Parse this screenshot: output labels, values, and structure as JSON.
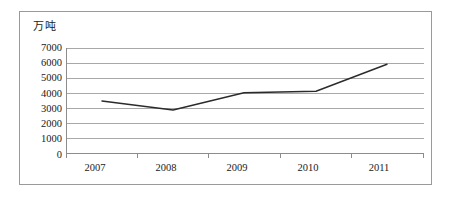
{
  "chart_data": {
    "type": "line",
    "title": "",
    "subtitle": "",
    "xlabel": "",
    "ylabel": "万吨",
    "unit_label": "万吨",
    "categories": [
      "2007",
      "2008",
      "2009",
      "2010",
      "2011"
    ],
    "x": [
      2007,
      2008,
      2009,
      2010,
      2011
    ],
    "values": [
      3500,
      2900,
      4050,
      4150,
      5950
    ],
    "series": [
      {
        "name": "",
        "values": [
          3500,
          2900,
          4050,
          4150,
          5950
        ]
      }
    ],
    "ylim": [
      0,
      7000
    ],
    "yticks": [
      0,
      1000,
      2000,
      3000,
      4000,
      5000,
      6000,
      7000
    ],
    "ytick_labels": [
      "0",
      "1000",
      "2000",
      "3000",
      "4000",
      "5000",
      "6000",
      "7000"
    ],
    "xtick_labels": [
      "2007",
      "2008",
      "2009",
      "2010",
      "2011"
    ],
    "grid": true,
    "grid_axis": "y",
    "legend": false,
    "legend_position": "none",
    "line_color": "#2b2b2b",
    "grid_color": "#a8a8a8",
    "axis_color": "#8c8c8c",
    "frame_color": "#9a9a9a",
    "background": "#ffffff",
    "markers": false,
    "annotations": []
  },
  "yticks": {
    "t0": "7000",
    "t1": "6000",
    "t2": "5000",
    "t3": "4000",
    "t4": "3000",
    "t5": "2000",
    "t6": "1000",
    "t7": "0"
  },
  "xticks": {
    "t0": "2007",
    "t1": "2008",
    "t2": "2009",
    "t3": "2010",
    "t4": "2011"
  }
}
